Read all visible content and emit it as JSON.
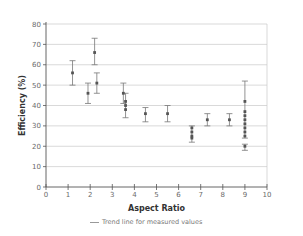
{
  "chart_data": {
    "type": "scatter",
    "title": "",
    "xlabel": "Aspect Ratio",
    "ylabel": "Efficiency (%)",
    "xlim": [
      0,
      10
    ],
    "ylim": [
      0,
      80
    ],
    "xticks": [
      0,
      1,
      2,
      3,
      4,
      5,
      6,
      7,
      8,
      9,
      10
    ],
    "yticks": [
      0,
      10,
      20,
      30,
      40,
      50,
      60,
      70,
      80
    ],
    "grid": "horizontal",
    "legend": {
      "position": "bottom",
      "entries": [
        "Trend line for measured values"
      ]
    },
    "points": [
      {
        "x": 1.2,
        "y": 56,
        "err_low": 50,
        "err_high": 62
      },
      {
        "x": 1.9,
        "y": 46,
        "err_low": 41,
        "err_high": 51
      },
      {
        "x": 2.2,
        "y": 66,
        "err_low": 60,
        "err_high": 73
      },
      {
        "x": 2.3,
        "y": 51,
        "err_low": 46,
        "err_high": 56
      },
      {
        "x": 3.5,
        "y": 46,
        "err_low": 41,
        "err_high": 51
      },
      {
        "x": 3.6,
        "y": 42,
        "err_low": 34,
        "err_high": 46
      },
      {
        "x": 3.6,
        "y": 40
      },
      {
        "x": 3.6,
        "y": 38
      },
      {
        "x": 4.5,
        "y": 36,
        "err_low": 32,
        "err_high": 39
      },
      {
        "x": 5.5,
        "y": 36,
        "err_low": 32,
        "err_high": 40
      },
      {
        "x": 6.6,
        "y": 29,
        "err_low": 22,
        "err_high": 30
      },
      {
        "x": 6.6,
        "y": 27
      },
      {
        "x": 6.6,
        "y": 25
      },
      {
        "x": 6.6,
        "y": 24
      },
      {
        "x": 7.3,
        "y": 33,
        "err_low": 30,
        "err_high": 36
      },
      {
        "x": 8.3,
        "y": 33,
        "err_low": 30,
        "err_high": 36
      },
      {
        "x": 9.0,
        "y": 42,
        "err_low": 24,
        "err_high": 52
      },
      {
        "x": 9.0,
        "y": 37
      },
      {
        "x": 9.0,
        "y": 35
      },
      {
        "x": 9.0,
        "y": 33
      },
      {
        "x": 9.0,
        "y": 31
      },
      {
        "x": 9.0,
        "y": 29
      },
      {
        "x": 9.0,
        "y": 27
      },
      {
        "x": 9.0,
        "y": 25
      },
      {
        "x": 9.0,
        "y": 20,
        "err_low": 18,
        "err_high": 21
      }
    ]
  },
  "labels": {
    "xlabel": "Aspect Ratio",
    "ylabel": "Efficiency (%)",
    "legend": "Trend line for measured values"
  },
  "colors": {
    "grid": "#c8c8c8",
    "axis": "#555555",
    "marker": "#555555",
    "errorbar": "#777777"
  }
}
